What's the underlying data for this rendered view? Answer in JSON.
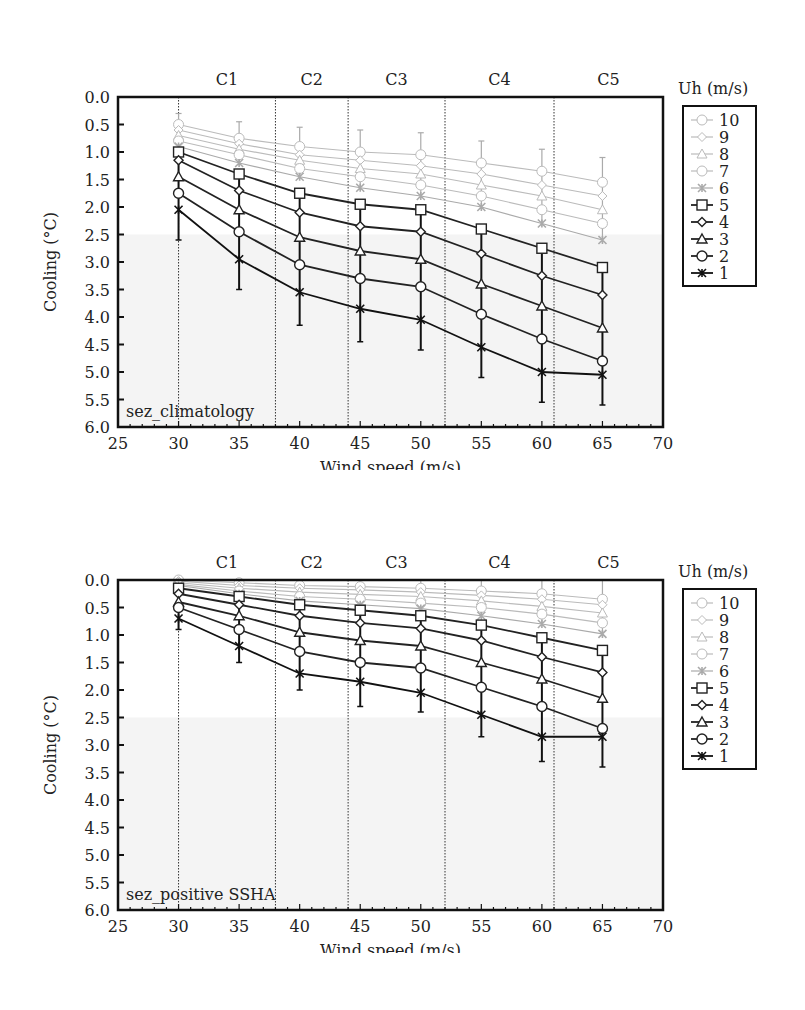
{
  "figure": {
    "legend_title": "Uh (m/s)",
    "x_axis_label": "Wind speed (m/s)",
    "y_axis_label": "Cooling (°C)",
    "category_labels": [
      "C1",
      "C2",
      "C3",
      "C4",
      "C5"
    ],
    "category_boundaries": [
      30,
      38,
      44,
      52,
      61
    ]
  },
  "chart_data": [
    {
      "panel_label": "(a)",
      "type": "line",
      "title": "",
      "annotation": "sez_climatology",
      "xlabel": "Wind speed (m/s)",
      "ylabel": "Cooling (°C)",
      "xlim": [
        25,
        70
      ],
      "ylim": [
        6.0,
        0.0
      ],
      "y_inverted": true,
      "x_ticks": [
        25,
        30,
        35,
        40,
        45,
        50,
        55,
        60,
        65,
        70
      ],
      "y_ticks": [
        "0.0",
        "0.5",
        "1.0",
        "1.5",
        "2.0",
        "2.5",
        "3.0",
        "3.5",
        "4.0",
        "4.5",
        "5.0",
        "5.5",
        "6.0"
      ],
      "category_labels": [
        "C1",
        "C2",
        "C3",
        "C4",
        "C5"
      ],
      "category_dividers": [
        30,
        38,
        44,
        52,
        61
      ],
      "legend_title": "Uh (m/s)",
      "legend_position": "right",
      "grid": false,
      "x": [
        30,
        35,
        40,
        45,
        50,
        55,
        60,
        65
      ],
      "series": [
        {
          "name": "10",
          "marker": "circle",
          "color": "#bbbbbb",
          "values": [
            0.5,
            0.75,
            0.9,
            1.0,
            1.05,
            1.2,
            1.35,
            1.55
          ]
        },
        {
          "name": "9",
          "marker": "diamond",
          "color": "#bbbbbb",
          "values": [
            0.6,
            0.85,
            1.05,
            1.15,
            1.25,
            1.4,
            1.6,
            1.8
          ]
        },
        {
          "name": "8",
          "marker": "triangle",
          "color": "#bbbbbb",
          "values": [
            0.7,
            0.95,
            1.15,
            1.3,
            1.4,
            1.6,
            1.8,
            2.05
          ]
        },
        {
          "name": "7",
          "marker": "circle",
          "color": "#bbbbbb",
          "values": [
            0.8,
            1.05,
            1.3,
            1.45,
            1.6,
            1.8,
            2.05,
            2.3
          ]
        },
        {
          "name": "6",
          "marker": "star",
          "color": "#aaaaaa",
          "values": [
            0.9,
            1.2,
            1.45,
            1.65,
            1.8,
            2.0,
            2.3,
            2.6
          ]
        },
        {
          "name": "5",
          "marker": "square",
          "color": "#222222",
          "values": [
            1.0,
            1.4,
            1.75,
            1.95,
            2.05,
            2.4,
            2.75,
            3.1
          ]
        },
        {
          "name": "4",
          "marker": "diamond",
          "color": "#222222",
          "values": [
            1.15,
            1.7,
            2.1,
            2.35,
            2.45,
            2.85,
            3.25,
            3.6
          ]
        },
        {
          "name": "3",
          "marker": "triangle",
          "color": "#222222",
          "values": [
            1.45,
            2.05,
            2.55,
            2.8,
            2.95,
            3.4,
            3.8,
            4.2
          ]
        },
        {
          "name": "2",
          "marker": "circle",
          "color": "#222222",
          "values": [
            1.75,
            2.45,
            3.05,
            3.3,
            3.45,
            3.95,
            4.4,
            4.8
          ]
        },
        {
          "name": "1",
          "marker": "star",
          "color": "#111111",
          "values": [
            2.05,
            2.95,
            3.55,
            3.85,
            4.05,
            4.55,
            5.0,
            5.05
          ]
        }
      ],
      "error_bars": {
        "series_10_upper": [
          0.3,
          0.45,
          0.55,
          0.6,
          0.65,
          0.8,
          0.95,
          1.1
        ],
        "series_1_lower": [
          2.6,
          3.5,
          4.15,
          4.45,
          4.6,
          5.1,
          5.55,
          5.6
        ]
      }
    },
    {
      "panel_label": "(b)",
      "type": "line",
      "title": "",
      "annotation": "sez_positive SSHA",
      "xlabel": "Wind speed (m/s)",
      "ylabel": "Cooling (°C)",
      "xlim": [
        25,
        70
      ],
      "ylim": [
        6.0,
        0.0
      ],
      "y_inverted": true,
      "x_ticks": [
        25,
        30,
        35,
        40,
        45,
        50,
        55,
        60,
        65,
        70
      ],
      "y_ticks": [
        "0.0",
        "0.5",
        "1.0",
        "1.5",
        "2.0",
        "2.5",
        "3.0",
        "3.5",
        "4.0",
        "4.5",
        "5.0",
        "5.5",
        "6.0"
      ],
      "category_labels": [
        "C1",
        "C2",
        "C3",
        "C4",
        "C5"
      ],
      "category_dividers": [
        30,
        38,
        44,
        52,
        61
      ],
      "legend_title": "Uh (m/s)",
      "legend_position": "right",
      "grid": false,
      "x": [
        30,
        35,
        40,
        45,
        50,
        55,
        60,
        65
      ],
      "series": [
        {
          "name": "10",
          "marker": "circle",
          "color": "#bbbbbb",
          "values": [
            0.0,
            0.05,
            0.1,
            0.12,
            0.15,
            0.2,
            0.25,
            0.35
          ]
        },
        {
          "name": "9",
          "marker": "diamond",
          "color": "#bbbbbb",
          "values": [
            0.02,
            0.1,
            0.15,
            0.18,
            0.22,
            0.28,
            0.35,
            0.45
          ]
        },
        {
          "name": "8",
          "marker": "triangle",
          "color": "#bbbbbb",
          "values": [
            0.05,
            0.15,
            0.22,
            0.26,
            0.3,
            0.38,
            0.48,
            0.6
          ]
        },
        {
          "name": "7",
          "marker": "circle",
          "color": "#bbbbbb",
          "values": [
            0.08,
            0.2,
            0.3,
            0.35,
            0.42,
            0.5,
            0.62,
            0.78
          ]
        },
        {
          "name": "6",
          "marker": "star",
          "color": "#aaaaaa",
          "values": [
            0.1,
            0.25,
            0.38,
            0.45,
            0.52,
            0.65,
            0.8,
            0.98
          ]
        },
        {
          "name": "5",
          "marker": "square",
          "color": "#222222",
          "values": [
            0.15,
            0.3,
            0.45,
            0.55,
            0.65,
            0.82,
            1.05,
            1.28
          ]
        },
        {
          "name": "4",
          "marker": "diamond",
          "color": "#222222",
          "values": [
            0.25,
            0.45,
            0.65,
            0.78,
            0.88,
            1.1,
            1.4,
            1.68
          ]
        },
        {
          "name": "3",
          "marker": "triangle",
          "color": "#222222",
          "values": [
            0.4,
            0.65,
            0.95,
            1.1,
            1.2,
            1.5,
            1.8,
            2.15
          ]
        },
        {
          "name": "2",
          "marker": "circle",
          "color": "#222222",
          "values": [
            0.5,
            0.9,
            1.3,
            1.5,
            1.6,
            1.95,
            2.3,
            2.7
          ]
        },
        {
          "name": "1",
          "marker": "star",
          "color": "#111111",
          "values": [
            0.7,
            1.2,
            1.7,
            1.85,
            2.05,
            2.45,
            2.85,
            2.85
          ]
        }
      ],
      "error_bars": {
        "series_10_upper": [
          0.0,
          0.0,
          0.0,
          0.0,
          0.0,
          0.0,
          0.0,
          0.0
        ],
        "series_1_lower": [
          0.9,
          1.5,
          2.0,
          2.3,
          2.4,
          2.85,
          3.3,
          3.4
        ]
      }
    }
  ]
}
